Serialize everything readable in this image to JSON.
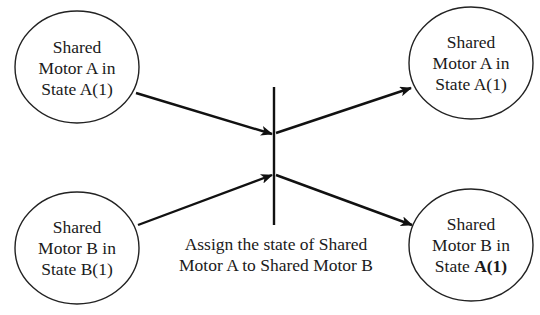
{
  "nodes": {
    "a_in": {
      "line1": "Shared",
      "line2": "Motor A in",
      "line3_prefix": "State ",
      "line3_state": "A(1)"
    },
    "b_in": {
      "line1": "Shared",
      "line2": "Motor B in",
      "line3_prefix": "State ",
      "line3_state": "B(1)"
    },
    "a_out": {
      "line1": "Shared",
      "line2": "Motor A in",
      "line3_prefix": "State ",
      "line3_state": "A(1)"
    },
    "b_out": {
      "line1": "Shared",
      "line2": "Motor B in",
      "line3_prefix": "State ",
      "line3_state": "A(1)"
    }
  },
  "transition": {
    "caption_line1": "Assign the state of Shared",
    "caption_line2": "Motor A to Shared Motor B"
  },
  "colors": {
    "stroke": "#111111",
    "background": "#ffffff"
  }
}
